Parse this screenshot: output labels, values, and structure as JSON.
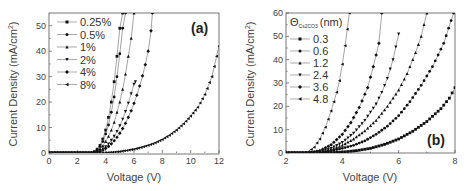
{
  "chart_data": [
    {
      "type": "line",
      "panel_label": "(a)",
      "xlabel": "Voltage (V)",
      "ylabel": "Current Density (mA/cm2)",
      "xlim": [
        0,
        12
      ],
      "ylim": [
        0,
        55
      ],
      "xticks": [
        0,
        2,
        4,
        6,
        8,
        10,
        12
      ],
      "yticks": [
        0,
        10,
        20,
        30,
        40,
        50
      ],
      "legend_position": "upper-left",
      "grid": false,
      "series": [
        {
          "name": "0.25%",
          "marker": "square",
          "x": [
            0,
            1,
            2,
            3,
            3.2,
            3.4,
            3.6,
            3.8,
            4.0,
            4.2,
            4.4,
            4.6,
            4.8,
            5.0,
            5.2
          ],
          "y": [
            0,
            0,
            0,
            0,
            0.5,
            1.5,
            3,
            5.5,
            9,
            14,
            20,
            28,
            38,
            49,
            55
          ]
        },
        {
          "name": "0.5%",
          "marker": "circle",
          "x": [
            0,
            1,
            2,
            3,
            3.2,
            3.4,
            3.6,
            3.8,
            4.0,
            4.2,
            4.4,
            4.6,
            4.8,
            5.0,
            5.2,
            5.4
          ],
          "y": [
            0,
            0,
            0,
            0,
            0.4,
            1.2,
            2.5,
            4.5,
            7.5,
            11,
            16,
            22,
            30,
            39,
            49,
            55
          ]
        },
        {
          "name": "1%",
          "marker": "triangle-up",
          "x": [
            0,
            1,
            2,
            3,
            3.2,
            3.4,
            3.6,
            3.8,
            4.0,
            4.2,
            4.4,
            4.6,
            4.8,
            5.0,
            5.2,
            5.4,
            5.6,
            5.8,
            6.0
          ],
          "y": [
            0,
            0,
            0,
            0,
            0.3,
            0.8,
            1.6,
            2.8,
            4.5,
            6.5,
            9,
            12,
            16,
            20,
            25,
            31,
            38,
            45,
            55
          ]
        },
        {
          "name": "2%",
          "marker": "triangle-down",
          "x": [
            0,
            1,
            2,
            3,
            3.4,
            3.6,
            3.8,
            4.0,
            4.2,
            4.4,
            4.6,
            4.8,
            5.0,
            5.2,
            5.4,
            5.6,
            5.8,
            6.0,
            6.1
          ],
          "y": [
            0,
            0,
            0,
            0,
            0.4,
            0.9,
            1.6,
            2.5,
            3.6,
            5,
            6.6,
            8.5,
            10.7,
            13.3,
            16.3,
            19.6,
            23.3,
            27,
            28
          ]
        },
        {
          "name": "4%",
          "marker": "diamond",
          "x": [
            0,
            1,
            2,
            3,
            3.4,
            3.6,
            3.8,
            4.0,
            4.2,
            4.4,
            4.6,
            4.8,
            5.0,
            5.2,
            5.4,
            5.6,
            5.8,
            6.0,
            6.2,
            6.4,
            6.6,
            6.8,
            7.0,
            7.2,
            7.3
          ],
          "y": [
            0,
            0,
            0,
            0,
            0.3,
            0.6,
            1.1,
            1.8,
            2.6,
            3.6,
            4.8,
            6.2,
            7.8,
            9.6,
            11.7,
            14,
            16.6,
            19.5,
            22.7,
            26.3,
            30.3,
            34.7,
            40,
            48,
            55
          ]
        },
        {
          "name": "8%",
          "marker": "triangle-left",
          "x": [
            0,
            1,
            2,
            3,
            4,
            4.5,
            5,
            5.5,
            6,
            6.5,
            7,
            7.5,
            8,
            8.5,
            9,
            9.5,
            10,
            10.5,
            11,
            11.5,
            12
          ],
          "y": [
            0,
            0,
            0,
            0,
            0.1,
            0.3,
            0.6,
            1,
            1.5,
            2.2,
            3,
            4,
            5.3,
            7,
            9,
            11.5,
            14.5,
            18,
            23,
            30,
            42
          ]
        }
      ]
    },
    {
      "type": "line",
      "panel_label": "(b)",
      "xlabel": "Voltage (V)",
      "ylabel": "Current Density (mA/cm2)",
      "legend_title": "ΘCs2CO3 (nm)",
      "xlim": [
        2,
        8
      ],
      "ylim": [
        0,
        60
      ],
      "xticks": [
        2,
        4,
        6,
        8
      ],
      "yticks": [
        0,
        10,
        20,
        30,
        40,
        50,
        60
      ],
      "legend_position": "upper-left",
      "grid": false,
      "series": [
        {
          "name": "0.3",
          "marker": "square",
          "x": [
            2,
            3,
            3.5,
            4,
            4.5,
            5,
            5.5,
            6,
            6.5,
            7,
            7.5,
            7.8,
            8
          ],
          "y": [
            0,
            0,
            0.1,
            0.4,
            1,
            2,
            3.7,
            6,
            9.3,
            13.5,
            19,
            23.5,
            28
          ]
        },
        {
          "name": "0.6",
          "marker": "circle",
          "x": [
            2,
            2.8,
            3.2,
            3.6,
            4,
            4.4,
            4.8,
            5.2,
            5.6,
            6,
            6.4,
            6.8,
            7.2,
            7.6,
            7.95
          ],
          "y": [
            0,
            0,
            0.3,
            1,
            2,
            3.3,
            5.2,
            8,
            11.5,
            16,
            22,
            29,
            37,
            47,
            60
          ]
        },
        {
          "name": "1.2",
          "marker": "triangle-up",
          "x": [
            2,
            2.8,
            3.2,
            3.6,
            4,
            4.4,
            4.8,
            5.2,
            5.6,
            6,
            6.3,
            6.6,
            6.8,
            7.0
          ],
          "y": [
            0,
            0,
            0.5,
            1.5,
            3.3,
            6,
            9.5,
            14,
            20,
            27,
            34,
            43,
            50,
            60
          ]
        },
        {
          "name": "2.4",
          "marker": "triangle-down",
          "x": [
            2,
            2.8,
            3.2,
            3.6,
            4,
            4.4,
            4.8,
            5.2,
            5.4,
            5.6,
            5.8,
            6.0
          ],
          "y": [
            0,
            0,
            0.6,
            2,
            4.5,
            8.5,
            14,
            21,
            26,
            32,
            40,
            51
          ]
        },
        {
          "name": "3.6",
          "marker": "diamond",
          "x": [
            2,
            2.8,
            3.2,
            3.6,
            4,
            4.3,
            4.6,
            4.9,
            5.1,
            5.3,
            5.4
          ],
          "y": [
            0,
            0,
            1,
            3.5,
            8,
            13,
            19.5,
            28,
            37,
            47,
            60
          ]
        },
        {
          "name": "4.8",
          "marker": "triangle-left",
          "x": [
            2,
            2.6,
            2.8,
            3,
            3.2,
            3.4,
            3.6,
            3.8,
            3.9,
            4.0,
            4.1,
            4.25
          ],
          "y": [
            0,
            0,
            0.5,
            2.5,
            6,
            11,
            18,
            26,
            31,
            38,
            46,
            60
          ]
        }
      ]
    }
  ],
  "panels": {
    "a": {
      "label": "(a)",
      "xlabel": "Voltage (V)",
      "ylabel": "Current Density (mA/cm"
    },
    "b": {
      "label": "(b)",
      "xlabel": "Voltage (V)",
      "ylabel": "Current Density (mA/cm",
      "legend_title_main": "Θ",
      "legend_title_sub": "Cs2CO3",
      "legend_title_unit": "(nm)"
    }
  }
}
